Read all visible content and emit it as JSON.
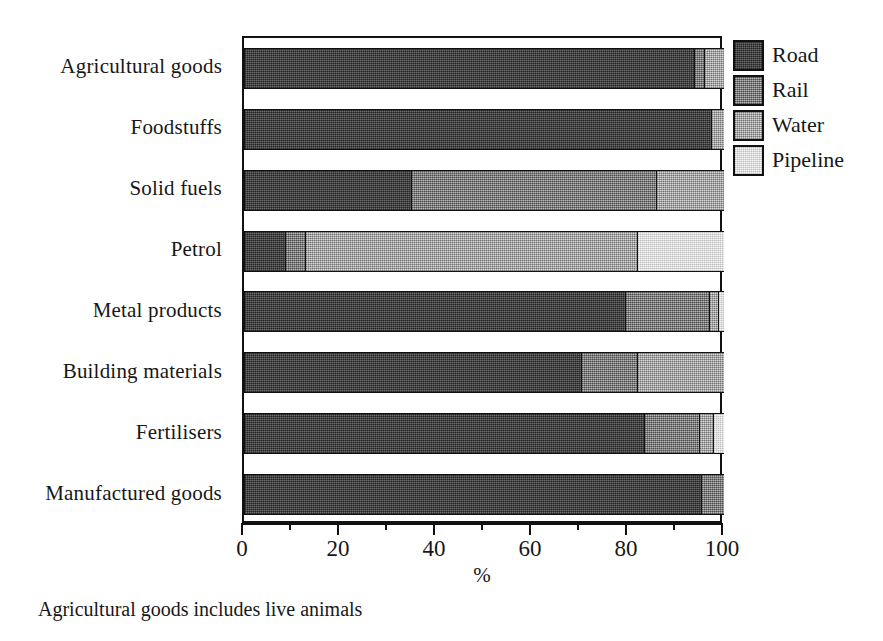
{
  "chart_data": {
    "type": "bar",
    "orientation": "horizontal",
    "stacked": true,
    "stack_mode": "percent",
    "title": "",
    "xlabel": "%",
    "ylabel": "",
    "xlim": [
      0,
      100
    ],
    "xticks": [
      0,
      20,
      40,
      60,
      80,
      100
    ],
    "xtick_labels": [
      "0",
      "20",
      "40",
      "60",
      "80",
      "100"
    ],
    "xminor_ticks": [
      10,
      30,
      50,
      70,
      90
    ],
    "grid": false,
    "legend_position": "right",
    "categories": [
      "Agricultural goods",
      "Foodstuffs",
      "Solid fuels",
      "Petrol",
      "Metal products",
      "Building materials",
      "Fertilisers",
      "Manufactured goods"
    ],
    "series": [
      {
        "name": "Road",
        "color": "#4a4a4a",
        "values": [
          94.0,
          97.5,
          35.0,
          8.7,
          79.5,
          70.5,
          83.5,
          95.5
        ]
      },
      {
        "name": "Rail",
        "color": "#8c8c8c",
        "values": [
          2.0,
          0.0,
          51.0,
          4.3,
          17.5,
          11.5,
          11.5,
          4.5
        ]
      },
      {
        "name": "Water",
        "color": "#b5b5b5",
        "values": [
          4.0,
          2.5,
          14.0,
          69.0,
          2.0,
          18.0,
          3.0,
          0.0
        ]
      },
      {
        "name": "Pipeline",
        "color": "#e6e6e6",
        "values": [
          0.0,
          0.0,
          0.0,
          18.0,
          1.0,
          0.0,
          2.0,
          0.0
        ]
      }
    ],
    "annotation": "Agricultural goods includes live animals"
  },
  "legend": {
    "items": [
      {
        "label": "Road",
        "swatch": "legend-swatch-road"
      },
      {
        "label": "Rail",
        "swatch": "legend-swatch-rail"
      },
      {
        "label": "Water",
        "swatch": "legend-swatch-water"
      },
      {
        "label": "Pipeline",
        "swatch": "legend-swatch-pipeline"
      }
    ]
  },
  "axis": {
    "title": "%",
    "labels": [
      "0",
      "20",
      "40",
      "60",
      "80",
      "100"
    ]
  },
  "footnote": "Agricultural goods includes live animals"
}
